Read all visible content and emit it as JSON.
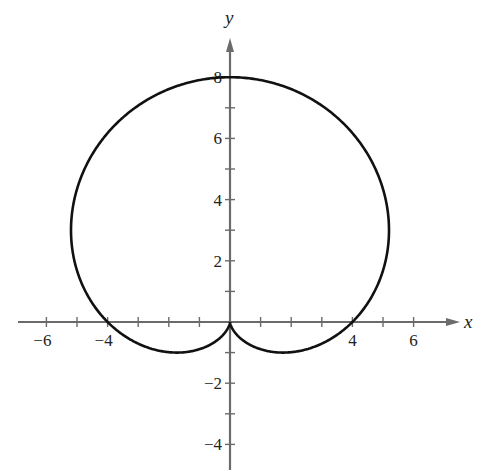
{
  "chart_data": {
    "type": "line",
    "title": "",
    "equation": "r = 4 + 4 sin θ",
    "xlabel": "x",
    "ylabel": "y",
    "xlim": [
      -7.1,
      7.4
    ],
    "ylim": [
      -4.8,
      9.4
    ],
    "grid": false,
    "legend": null,
    "x_tick_labels": [
      "−6",
      "−4",
      "4",
      "6"
    ],
    "x_tick_label_values": [
      -6,
      -4,
      4,
      6
    ],
    "x_ticks": [
      -6,
      -5,
      -4,
      -3,
      -2,
      -1,
      1,
      2,
      3,
      4,
      5,
      6
    ],
    "y_tick_labels": [
      "8",
      "6",
      "4",
      "2",
      "−2",
      "−4"
    ],
    "y_tick_label_values": [
      8,
      6,
      4,
      2,
      -2,
      -4
    ],
    "y_ticks": [
      -4,
      -3,
      -2,
      -1,
      1,
      2,
      3,
      4,
      5,
      6,
      7,
      8
    ],
    "key_points": [
      {
        "x": 0,
        "y": 8,
        "note": "top"
      },
      {
        "x": 4,
        "y": 0,
        "note": "x-intercept"
      },
      {
        "x": -4,
        "y": 0,
        "note": "x-intercept"
      },
      {
        "x": 0,
        "y": 0,
        "note": "cusp"
      },
      {
        "x": 5.2,
        "y": 3.0,
        "note": "rightmost"
      },
      {
        "x": -5.2,
        "y": 3.0,
        "note": "leftmost"
      },
      {
        "x": 1.3,
        "y": -0.75,
        "note": "lowest right lobe"
      },
      {
        "x": -1.3,
        "y": -0.75,
        "note": "lowest left lobe"
      }
    ]
  },
  "layout": {
    "origin_px": [
      230,
      322
    ],
    "px_per_unit": 30.6,
    "curve_color": "#111111",
    "axis_color": "#6b6b6b"
  }
}
